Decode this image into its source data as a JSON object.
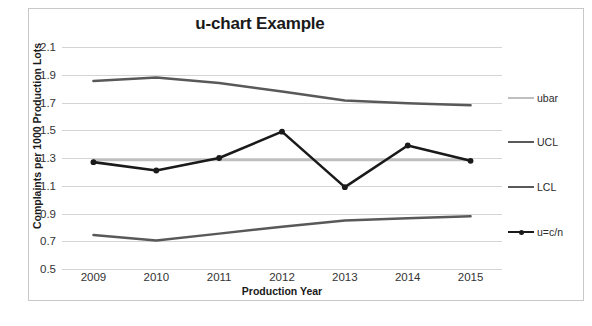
{
  "chart_data": {
    "type": "line",
    "title": "u-chart Example",
    "xlabel": "Production Year",
    "ylabel": "Complaints per 1000 Production Lots",
    "categories": [
      "2009",
      "2010",
      "2011",
      "2012",
      "2013",
      "2014",
      "2015"
    ],
    "x": [
      2009,
      2010,
      2011,
      2012,
      2013,
      2014,
      2015
    ],
    "ylim": [
      0.5,
      2.1
    ],
    "ytick_labels": [
      "2.1",
      "1.9",
      "1.7",
      "1.5",
      "1.3",
      "1.1",
      "0.9",
      "0.7",
      "0.5"
    ],
    "ytick_values": [
      2.1,
      1.9,
      1.7,
      1.5,
      1.3,
      1.1,
      0.9,
      0.7,
      0.5
    ],
    "grid": true,
    "legend_position": "right",
    "series": [
      {
        "name": "ubar",
        "color": "#bfbfbf",
        "width": 2.5,
        "markers": false,
        "values": [
          1.285,
          1.285,
          1.285,
          1.285,
          1.285,
          1.285,
          1.285
        ]
      },
      {
        "name": "UCL",
        "color": "#595959",
        "width": 2.5,
        "markers": false,
        "values": [
          1.855,
          1.88,
          1.84,
          1.78,
          1.715,
          1.695,
          1.68
        ]
      },
      {
        "name": "LCL",
        "color": "#595959",
        "width": 2.5,
        "markers": false,
        "values": [
          0.745,
          0.705,
          0.755,
          0.805,
          0.85,
          0.865,
          0.88
        ]
      },
      {
        "name": "u=c/n",
        "color": "#1a1a1a",
        "width": 2.6,
        "markers": true,
        "values": [
          1.27,
          1.21,
          1.3,
          1.49,
          1.09,
          1.39,
          1.28
        ]
      }
    ],
    "legend": [
      {
        "label": "ubar",
        "color": "#bfbfbf",
        "markers": false
      },
      {
        "label": "UCL",
        "color": "#595959",
        "markers": false
      },
      {
        "label": "LCL",
        "color": "#595959",
        "markers": false
      },
      {
        "label": "u=c/n",
        "color": "#1a1a1a",
        "markers": true
      }
    ],
    "colors": {
      "ubar": "#bfbfbf",
      "ucl": "#595959",
      "lcl": "#595959",
      "u": "#1a1a1a",
      "grid": "#d4d4d4",
      "border": "#c8c8c8",
      "text": "#333333"
    }
  }
}
